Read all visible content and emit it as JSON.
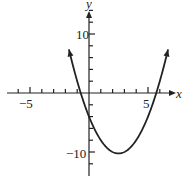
{
  "chart_data": {
    "type": "line",
    "title": "",
    "xlabel": "x",
    "ylabel": "y",
    "function": "y = x^2 - 5x - 4",
    "xlim": [
      -7.5,
      7.5
    ],
    "ylim": [
      -12.5,
      15
    ],
    "x_tick_labels": [
      "-5",
      "5"
    ],
    "y_tick_labels": [
      "10",
      "-10"
    ],
    "x_ticks_every": 1,
    "y_ticks_every": 2,
    "grid": false,
    "series": [
      {
        "name": "parabola",
        "x": [
          -1.5,
          -1,
          -0.5,
          0,
          0.5,
          1,
          1.5,
          2,
          2.5,
          3,
          3.5,
          4,
          4.5,
          5,
          5.5,
          6,
          6.5
        ],
        "y": [
          5.75,
          2,
          -1.25,
          -4,
          -6.25,
          -8,
          -9.25,
          -10,
          -10.25,
          -10,
          -9.25,
          -8,
          -6.25,
          -4,
          -1.25,
          2,
          5.75
        ]
      }
    ],
    "vertex": [
      2.5,
      -10.25
    ]
  },
  "labels": {
    "x_axis": "x",
    "y_axis": "y",
    "x_neg5": "−5",
    "x_pos5": "5",
    "y_pos10": "10",
    "y_neg10": "−10"
  }
}
